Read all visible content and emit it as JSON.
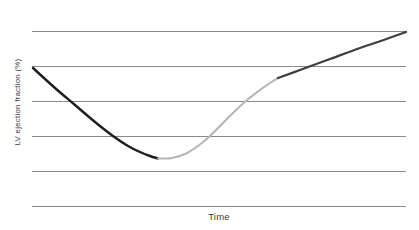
{
  "figure": {
    "background": "#ffffff",
    "text_color": "#3a3a3a"
  },
  "chart_data": {
    "type": "line",
    "title": "",
    "xlabel": "Time",
    "ylabel": "LV ejection fraction (%)",
    "axis_ticks": {
      "x": [],
      "y": []
    },
    "legend": {
      "visible": false
    },
    "grid": {
      "horizontal_lines": 6,
      "vertical_lines": 0,
      "color": "#8a8a8a",
      "stroke_width": 1
    },
    "plot_area_px": {
      "x_start": 32,
      "x_end": 406,
      "y_first_line": 31.5,
      "line_spacing": 35
    },
    "series": [
      {
        "name": "initial-decline",
        "color": "#1e1e1e",
        "stroke_width": 2.4,
        "points_px": [
          [
            33,
            68
          ],
          [
            55,
            88
          ],
          [
            75,
            105
          ],
          [
            95,
            122
          ],
          [
            113,
            136
          ],
          [
            128,
            146
          ],
          [
            140,
            152
          ],
          [
            150,
            156
          ],
          [
            158,
            158.5
          ]
        ]
      },
      {
        "name": "early-recovery",
        "color": "#b6b6b6",
        "stroke_width": 2.1,
        "points_px": [
          [
            158,
            158.5
          ],
          [
            172,
            158
          ],
          [
            185,
            154
          ],
          [
            198,
            146
          ],
          [
            210,
            136
          ],
          [
            222,
            124
          ],
          [
            234,
            112
          ],
          [
            247,
            100
          ],
          [
            260,
            90
          ],
          [
            270,
            83
          ],
          [
            278,
            78
          ]
        ]
      },
      {
        "name": "late-recovery",
        "color": "#3e3e3e",
        "stroke_width": 2.2,
        "points_px": [
          [
            278,
            78
          ],
          [
            300,
            70
          ],
          [
            330,
            59
          ],
          [
            360,
            48
          ],
          [
            385,
            39.5
          ],
          [
            406,
            32
          ]
        ]
      }
    ]
  }
}
